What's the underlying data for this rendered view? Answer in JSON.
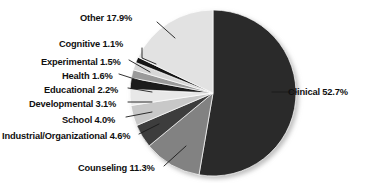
{
  "chart_data": {
    "type": "pie",
    "title": "",
    "subtitle": "",
    "xlabel": "",
    "ylabel": "",
    "legend_position": "none",
    "grid": false,
    "value_unit": "percent",
    "start_angle_deg": 0,
    "direction": "clockwise",
    "categories": [
      "Clinical",
      "Counseling",
      "Industrial/Organizational",
      "School",
      "Developmental",
      "Educational",
      "Health",
      "Experimental",
      "Cognitive",
      "Other"
    ],
    "values": [
      52.7,
      11.3,
      4.6,
      4.0,
      3.1,
      2.2,
      1.6,
      1.5,
      1.1,
      17.9
    ],
    "slices": [
      {
        "name": "Clinical",
        "value": 52.7,
        "label": "Clinical 52.7%",
        "color": "#2b2b2b",
        "label_side": "right",
        "label_x": 288,
        "label_y": 87,
        "leader": "M 272 92 L 297 92"
      },
      {
        "name": "Counseling",
        "value": 11.3,
        "label": "Counseling 11.3%",
        "color": "#828282",
        "label_side": "left",
        "label_x": 78,
        "label_y": 163,
        "leader": "M 164 166 L 186 146"
      },
      {
        "name": "Industrial/Organizational",
        "value": 4.6,
        "label": "Industrial/Organizational 4.6%",
        "color": "#3d3d3d",
        "label_side": "left",
        "label_x": 2,
        "label_y": 131,
        "leader": "M 139 134 L 159 124"
      },
      {
        "name": "School",
        "value": 4.0,
        "label": "School 4.0%",
        "color": "#c8c8c8",
        "label_side": "left",
        "label_x": 62,
        "label_y": 115,
        "leader": "M 126 117 L 152 112"
      },
      {
        "name": "Developmental",
        "value": 3.1,
        "label": "Developmental 3.1%",
        "color": "#e8e8e8",
        "label_side": "left",
        "label_x": 29,
        "label_y": 99,
        "leader": "M 128 102 L 152 102"
      },
      {
        "name": "Educational",
        "value": 2.2,
        "label": "Educational 2.2%",
        "color": "#1f1f1f",
        "label_side": "left",
        "label_x": 44,
        "label_y": 85,
        "leader": "M 128 88 L 152 92"
      },
      {
        "name": "Health",
        "value": 1.6,
        "label": "Health 1.6%",
        "color": "#9a9a9a",
        "label_side": "left",
        "label_x": 62,
        "label_y": 71,
        "leader": "M 119 74 L 147 83"
      },
      {
        "name": "Experimental",
        "value": 1.5,
        "label": "Experimental 1.5%",
        "color": "#d8d8d8",
        "label_side": "left",
        "label_x": 41,
        "label_y": 57,
        "leader": "M 129 60 L 150 72"
      },
      {
        "name": "Cognitive",
        "value": 1.1,
        "label": "Cognitive 1.1%",
        "color": "#151515",
        "label_side": "left",
        "label_x": 59,
        "label_y": 39,
        "leader": "M 142 48 L 142 58 L 156 64"
      },
      {
        "name": "Other",
        "value": 17.9,
        "label": "Other 17.9%",
        "color": "#e2e2e2",
        "label_side": "left",
        "label_x": 80,
        "label_y": 13,
        "leader": "M 157 22 L 175 38"
      }
    ]
  },
  "geometry": {
    "center_x": 213,
    "center_y": 93,
    "radius": 83
  }
}
